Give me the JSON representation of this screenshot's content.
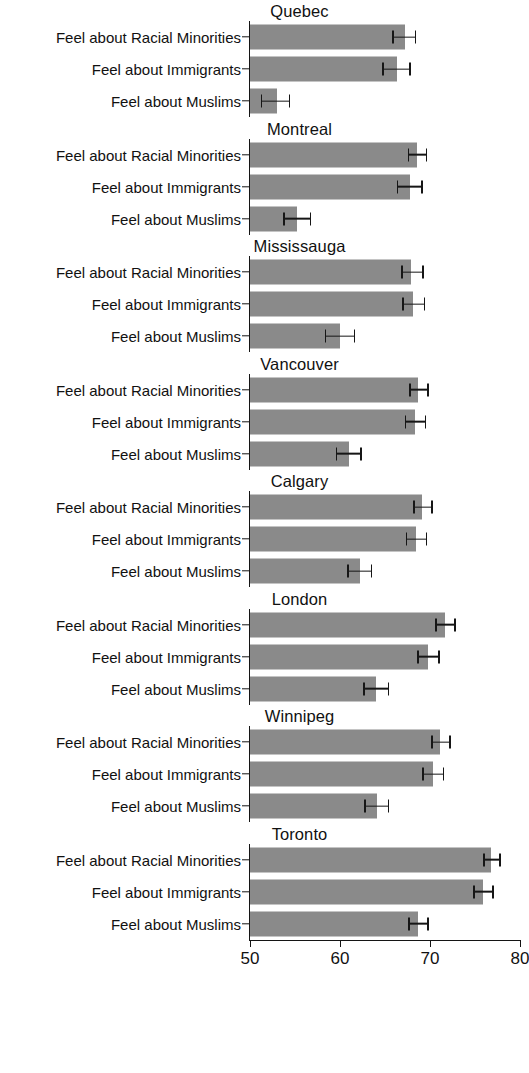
{
  "chart_data": {
    "type": "bar",
    "orientation": "horizontal",
    "title": "",
    "xlabel": "",
    "ylabel": "",
    "xlim": [
      50,
      80
    ],
    "xticks": [
      50,
      60,
      70,
      80
    ],
    "xtick_labels": [
      "50",
      "60",
      "70",
      "80"
    ],
    "grid": false,
    "legend": "none",
    "error_bars": "95% confidence interval",
    "bar_color": "#8a8a8a",
    "axis_color": "#141414",
    "categories": [
      "Feel about Racial Minorities",
      "Feel about Immigrants",
      "Feel about Muslims"
    ],
    "panels": [
      {
        "name": "Quebec",
        "values": [
          67.2,
          66.3,
          53.0
        ],
        "err_low": [
          65.8,
          64.7,
          51.2
        ],
        "err_high": [
          68.5,
          67.9,
          54.5
        ]
      },
      {
        "name": "Montreal",
        "values": [
          68.5,
          67.8,
          55.2
        ],
        "err_low": [
          67.5,
          66.3,
          53.7
        ],
        "err_high": [
          69.7,
          69.2,
          56.8
        ]
      },
      {
        "name": "Mississauga",
        "values": [
          67.9,
          68.1,
          60.0
        ],
        "err_low": [
          66.8,
          66.9,
          58.3
        ],
        "err_high": [
          69.3,
          69.5,
          61.7
        ]
      },
      {
        "name": "Vancouver",
        "values": [
          68.7,
          68.3,
          61.0
        ],
        "err_low": [
          67.7,
          67.2,
          59.5
        ],
        "err_high": [
          69.9,
          69.6,
          62.4
        ]
      },
      {
        "name": "Calgary",
        "values": [
          69.1,
          68.4,
          62.2
        ],
        "err_low": [
          68.1,
          67.3,
          60.8
        ],
        "err_high": [
          70.3,
          69.7,
          63.6
        ]
      },
      {
        "name": "London",
        "values": [
          71.7,
          69.8,
          64.0
        ],
        "err_low": [
          70.6,
          68.6,
          62.6
        ],
        "err_high": [
          72.9,
          71.1,
          65.5
        ]
      },
      {
        "name": "Winnipeg",
        "values": [
          71.1,
          70.3,
          64.1
        ],
        "err_low": [
          70.1,
          69.1,
          62.7
        ],
        "err_high": [
          72.3,
          71.6,
          65.5
        ]
      },
      {
        "name": "Toronto",
        "values": [
          76.8,
          75.9,
          68.7
        ],
        "err_low": [
          75.9,
          74.8,
          67.6
        ],
        "err_high": [
          77.9,
          77.1,
          69.9
        ]
      }
    ]
  }
}
